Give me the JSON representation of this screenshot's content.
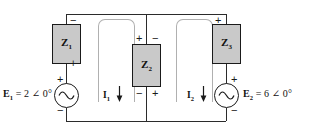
{
  "diagram": {
    "type": "circuit-schematic",
    "colors": {
      "wire": "#2b2b2b",
      "impedance_fill": "#c9c9c9",
      "impedance_border": "#1a1a1a",
      "loop_guide": "#b0b0b0",
      "text": "#111111",
      "background": "#ffffff"
    }
  },
  "impedances": [
    {
      "id": "Z1",
      "symbol": "Z",
      "subscript": "1",
      "polarity_top": "−",
      "polarity_bottom": "+",
      "branch": "left"
    },
    {
      "id": "Z2",
      "symbol": "Z",
      "subscript": "2",
      "polarity_top_left": "+",
      "polarity_top_right": "−",
      "polarity_bottom_left": "−",
      "polarity_bottom_right": "+",
      "branch": "center"
    },
    {
      "id": "Z3",
      "symbol": "Z",
      "subscript": "3",
      "polarity_top": "+",
      "polarity_bottom": "−",
      "branch": "right"
    }
  ],
  "sources": [
    {
      "id": "E1",
      "symbol": "E",
      "subscript": "1",
      "equation": "= 2 ∠ 0°",
      "full_label": "E₁ = 2 ∠ 0°",
      "magnitude": 2,
      "angle_deg": 0,
      "unit": "V",
      "polarity_top": "+",
      "polarity_bottom": "−",
      "waveform": "sine",
      "position": "left"
    },
    {
      "id": "E2",
      "symbol": "E",
      "subscript": "2",
      "equation": "= 6 ∠ 0°",
      "full_label": "E₂ = 6 ∠ 0°",
      "magnitude": 6,
      "angle_deg": 0,
      "unit": "V",
      "polarity_top": "+",
      "polarity_bottom": "−",
      "waveform": "sine",
      "position": "right"
    }
  ],
  "currents": [
    {
      "id": "I1",
      "symbol": "I",
      "subscript": "1",
      "direction": "down",
      "mesh": "left"
    },
    {
      "id": "I2",
      "symbol": "I",
      "subscript": "2",
      "direction": "down",
      "mesh": "right"
    }
  ]
}
